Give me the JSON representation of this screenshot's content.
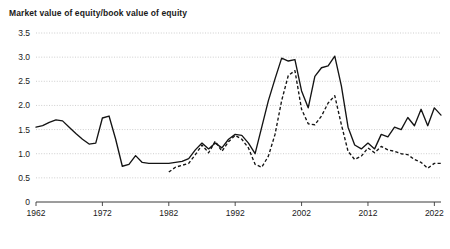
{
  "chart_data": {
    "type": "line",
    "title": "Market value of equity/book value of equity",
    "xlabel": "",
    "ylabel": "",
    "xlim": [
      1962,
      2023
    ],
    "ylim": [
      0,
      3.5
    ],
    "grid": true,
    "legend": "none",
    "yticks": [
      "0",
      "0.5",
      "1.0",
      "1.5",
      "2.0",
      "2.5",
      "3.0",
      "3.5"
    ],
    "ytick_values": [
      0,
      0.5,
      1.0,
      1.5,
      2.0,
      2.5,
      3.0,
      3.5
    ],
    "xticks": [
      "1962",
      "1972",
      "1982",
      "1992",
      "2002",
      "2012",
      "2022"
    ],
    "xtick_values": [
      1962,
      1972,
      1982,
      1992,
      2002,
      2012,
      2022
    ],
    "series": [
      {
        "name": "solid-line",
        "style": "solid",
        "color": "#141414",
        "x": [
          1962,
          1963,
          1964,
          1965,
          1966,
          1967,
          1968,
          1969,
          1970,
          1971,
          1972,
          1973,
          1974,
          1975,
          1976,
          1977,
          1978,
          1979,
          1980,
          1981,
          1982,
          1983,
          1984,
          1985,
          1986,
          1987,
          1988,
          1989,
          1990,
          1991,
          1992,
          1993,
          1994,
          1995,
          1996,
          1997,
          1998,
          1999,
          2000,
          2001,
          2002,
          2003,
          2004,
          2005,
          2006,
          2007,
          2008,
          2009,
          2010,
          2011,
          2012,
          2013,
          2014,
          2015,
          2016,
          2017,
          2018,
          2019,
          2020,
          2021,
          2022,
          2023
        ],
        "values": [
          1.55,
          1.58,
          1.65,
          1.7,
          1.68,
          1.55,
          1.42,
          1.3,
          1.2,
          1.22,
          1.74,
          1.78,
          1.3,
          0.74,
          0.78,
          0.96,
          0.82,
          0.8,
          0.8,
          0.8,
          0.8,
          0.82,
          0.84,
          0.9,
          1.08,
          1.22,
          1.1,
          1.22,
          1.12,
          1.3,
          1.4,
          1.38,
          1.22,
          1.0,
          1.55,
          2.1,
          2.55,
          2.98,
          2.92,
          2.95,
          2.3,
          1.95,
          2.6,
          2.78,
          2.82,
          3.02,
          2.4,
          1.55,
          1.18,
          1.1,
          1.22,
          1.1,
          1.4,
          1.35,
          1.55,
          1.5,
          1.75,
          1.58,
          1.92,
          1.58,
          1.95,
          1.8
        ]
      },
      {
        "name": "dashed-line",
        "style": "dashed",
        "color": "#141414",
        "x": [
          1982,
          1983,
          1984,
          1985,
          1986,
          1987,
          1988,
          1989,
          1990,
          1991,
          1992,
          1993,
          1994,
          1995,
          1996,
          1997,
          1998,
          1999,
          2000,
          2001,
          2002,
          2003,
          2004,
          2005,
          2006,
          2007,
          2008,
          2009,
          2010,
          2011,
          2012,
          2013,
          2014,
          2015,
          2016,
          2017,
          2018,
          2019,
          2020,
          2021,
          2022,
          2023
        ],
        "values": [
          0.62,
          0.72,
          0.76,
          0.8,
          0.98,
          1.18,
          1.02,
          1.26,
          1.05,
          1.25,
          1.38,
          1.3,
          1.12,
          0.78,
          0.72,
          0.95,
          1.4,
          2.1,
          2.62,
          2.72,
          1.92,
          1.62,
          1.6,
          1.78,
          2.05,
          2.2,
          1.6,
          1.05,
          0.88,
          0.95,
          1.12,
          1.02,
          1.15,
          1.08,
          1.05,
          1.0,
          0.98,
          0.88,
          0.82,
          0.7,
          0.8,
          0.8
        ]
      }
    ]
  }
}
